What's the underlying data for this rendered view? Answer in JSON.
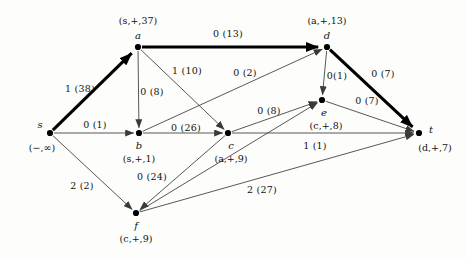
{
  "figure": {
    "type": "flow-network-graph",
    "colors": {
      "background": "#fdfdfc",
      "edge": "#3a3a3a",
      "edge_highlight": "#000000",
      "node": "#000000",
      "text": "#111111"
    }
  },
  "nodes": [
    {
      "id": "s",
      "name": "s",
      "tag": "(−,∞)",
      "x": 50,
      "y": 133,
      "name_dx": -10,
      "name_dy": -9,
      "tag_dx": -8,
      "tag_dy": 14
    },
    {
      "id": "a",
      "name": "a",
      "tag": "(s,+,37)",
      "x": 138,
      "y": 47,
      "name_dx": 0,
      "name_dy": -12,
      "tag_dx": 0,
      "tag_dy": -27
    },
    {
      "id": "b",
      "name": "b",
      "tag": "(s,+,1)",
      "x": 139,
      "y": 133,
      "name_dx": 0,
      "name_dy": 12,
      "tag_dx": 0,
      "tag_dy": 25
    },
    {
      "id": "c",
      "name": "c",
      "tag": "(a,+,9)",
      "x": 228,
      "y": 133,
      "name_dx": 3,
      "name_dy": 12,
      "tag_dx": 3,
      "tag_dy": 25
    },
    {
      "id": "d",
      "name": "d",
      "tag": "(a,+,13)",
      "x": 327,
      "y": 47,
      "name_dx": 0,
      "name_dy": -12,
      "tag_dx": 0,
      "tag_dy": -27
    },
    {
      "id": "e",
      "name": "e",
      "tag": "(c,+,8)",
      "x": 322,
      "y": 100,
      "name_dx": 2,
      "name_dy": 12,
      "tag_dx": 4,
      "tag_dy": 25
    },
    {
      "id": "f",
      "name": "f",
      "tag": "(c,+,9)",
      "x": 136,
      "y": 213,
      "name_dx": 0,
      "name_dy": 12,
      "tag_dx": 0,
      "tag_dy": 25
    },
    {
      "id": "t",
      "name": "t",
      "tag": "(d,+,7)",
      "x": 419,
      "y": 133,
      "name_dx": 12,
      "name_dy": -4,
      "tag_dx": 16,
      "tag_dy": 14
    }
  ],
  "edges": [
    {
      "from": "s",
      "to": "a",
      "label": "1 (38)",
      "flow": 1,
      "capacity": 38,
      "highlight": true,
      "lx": 80,
      "ly": 88
    },
    {
      "from": "s",
      "to": "b",
      "label": "0 (1)",
      "flow": 0,
      "capacity": 1,
      "highlight": false,
      "lx": 95,
      "ly": 124
    },
    {
      "from": "s",
      "to": "f",
      "label": "2 (2)",
      "flow": 2,
      "capacity": 2,
      "highlight": false,
      "lx": 82,
      "ly": 185
    },
    {
      "from": "a",
      "to": "d",
      "label": "0 (13)",
      "flow": 0,
      "capacity": 13,
      "highlight": true,
      "lx": 228,
      "ly": 33
    },
    {
      "from": "a",
      "to": "b",
      "label": "0 (8)",
      "flow": 0,
      "capacity": 8,
      "highlight": false,
      "lx": 152,
      "ly": 91
    },
    {
      "from": "a",
      "to": "c",
      "label": "1 (10)",
      "flow": 1,
      "capacity": 10,
      "highlight": false,
      "lx": 187,
      "ly": 70
    },
    {
      "from": "b",
      "to": "c",
      "label": "0 (26)",
      "flow": 0,
      "capacity": 26,
      "highlight": false,
      "lx": 186,
      "ly": 127
    },
    {
      "from": "b",
      "to": "d",
      "label": "0 (2)",
      "flow": 0,
      "capacity": 2,
      "highlight": false,
      "lx": 245,
      "ly": 72
    },
    {
      "from": "c",
      "to": "e",
      "label": "0 (8)",
      "flow": 0,
      "capacity": 8,
      "highlight": false,
      "lx": 269,
      "ly": 110
    },
    {
      "from": "c",
      "to": "t",
      "label": "1 (1)",
      "flow": 1,
      "capacity": 1,
      "highlight": false,
      "lx": 315,
      "ly": 145
    },
    {
      "from": "c",
      "to": "f",
      "label": "0 (24)",
      "flow": 0,
      "capacity": 24,
      "highlight": false,
      "lx": 152,
      "ly": 176
    },
    {
      "from": "d",
      "to": "e",
      "label": "0(1)",
      "flow": 0,
      "capacity": 1,
      "highlight": false,
      "lx": 337,
      "ly": 75
    },
    {
      "from": "d",
      "to": "t",
      "label": "0 (7)",
      "flow": 0,
      "capacity": 7,
      "highlight": true,
      "lx": 383,
      "ly": 73
    },
    {
      "from": "e",
      "to": "t",
      "label": "0 (7)",
      "flow": 0,
      "capacity": 7,
      "highlight": false,
      "lx": 367,
      "ly": 100
    },
    {
      "from": "f",
      "to": "e",
      "label": "",
      "flow": null,
      "capacity": null,
      "highlight": false,
      "lx": 0,
      "ly": 0
    },
    {
      "from": "f",
      "to": "t",
      "label": "2 (27)",
      "flow": 2,
      "capacity": 27,
      "highlight": false,
      "lx": 262,
      "ly": 189
    }
  ]
}
